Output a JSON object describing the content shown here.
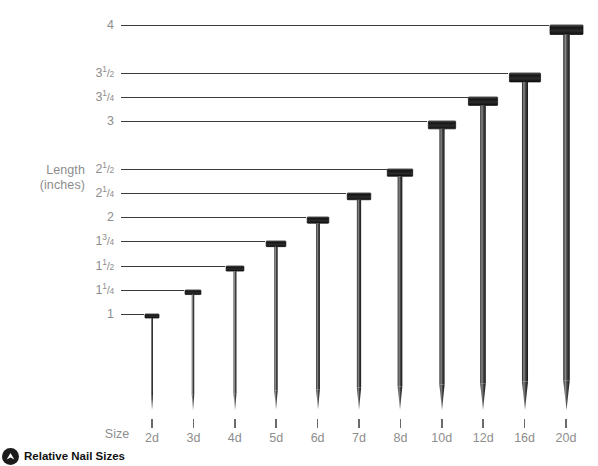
{
  "chart_data": {
    "type": "bar",
    "title": "Relative Nail Sizes",
    "xlabel": "Size",
    "ylabel": "Length (inches)",
    "ylim": [
      0,
      4
    ],
    "grid": false,
    "legend": null,
    "categories": [
      "2d",
      "3d",
      "4d",
      "5d",
      "6d",
      "7d",
      "8d",
      "10d",
      "12d",
      "16d",
      "20d"
    ],
    "values": [
      1,
      1.25,
      1.5,
      1.75,
      2,
      2.25,
      2.5,
      3,
      3.25,
      3.5,
      4
    ],
    "value_labels": [
      "1",
      "1 1/4",
      "1 1/2",
      "1 3/4",
      "2",
      "2 1/4",
      "2 1/2",
      "3",
      "3 1/4",
      "3 1/2",
      "4"
    ],
    "ytick_values": [
      1,
      1.25,
      1.5,
      1.75,
      2,
      2.25,
      2.5,
      3,
      3.25,
      3.5,
      4
    ],
    "series": [
      {
        "name": "Nail length (inches)",
        "values": [
          1,
          1.25,
          1.5,
          1.75,
          2,
          2.25,
          2.5,
          3,
          3.25,
          3.5,
          4
        ]
      }
    ]
  },
  "axis": {
    "y_title_line1": "Length",
    "y_title_line2": "(inches)",
    "x_title": "Size"
  },
  "yticks": [
    {
      "id": "y-4",
      "whole": "4",
      "num": "",
      "den": "",
      "value": 4.0
    },
    {
      "id": "y-3-1-2",
      "whole": "3",
      "num": "1",
      "den": "2",
      "value": 3.5
    },
    {
      "id": "y-3-1-4",
      "whole": "3",
      "num": "1",
      "den": "4",
      "value": 3.25
    },
    {
      "id": "y-3",
      "whole": "3",
      "num": "",
      "den": "",
      "value": 3.0
    },
    {
      "id": "y-2-1-2",
      "whole": "2",
      "num": "1",
      "den": "2",
      "value": 2.5
    },
    {
      "id": "y-2-1-4",
      "whole": "2",
      "num": "1",
      "den": "4",
      "value": 2.25
    },
    {
      "id": "y-2",
      "whole": "2",
      "num": "",
      "den": "",
      "value": 2.0
    },
    {
      "id": "y-1-3-4",
      "whole": "1",
      "num": "3",
      "den": "4",
      "value": 1.75
    },
    {
      "id": "y-1-1-2",
      "whole": "1",
      "num": "1",
      "den": "2",
      "value": 1.5
    },
    {
      "id": "y-1-1-4",
      "whole": "1",
      "num": "1",
      "den": "4",
      "value": 1.25
    },
    {
      "id": "y-1",
      "whole": "1",
      "num": "",
      "den": "",
      "value": 1.0
    }
  ],
  "xticks": [
    {
      "label": "2d",
      "value": 1.0
    },
    {
      "label": "3d",
      "value": 1.25
    },
    {
      "label": "4d",
      "value": 1.5
    },
    {
      "label": "5d",
      "value": 1.75
    },
    {
      "label": "6d",
      "value": 2.0
    },
    {
      "label": "7d",
      "value": 2.25
    },
    {
      "label": "8d",
      "value": 2.5
    },
    {
      "label": "10d",
      "value": 3.0
    },
    {
      "label": "12d",
      "value": 3.25
    },
    {
      "label": "16d",
      "value": 3.5
    },
    {
      "label": "20d",
      "value": 4.0
    }
  ],
  "footer": {
    "caption": "Relative Nail Sizes",
    "logo_name": "circle-chevron-logo"
  },
  "colors": {
    "background": "#ffffff",
    "label_gray": "#8d8d8d",
    "leader_line": "#3b3b3b",
    "nail_dark": "#1a1a1a",
    "nail_mid": "#5a5a5a",
    "nail_light": "#c9c9c9"
  }
}
